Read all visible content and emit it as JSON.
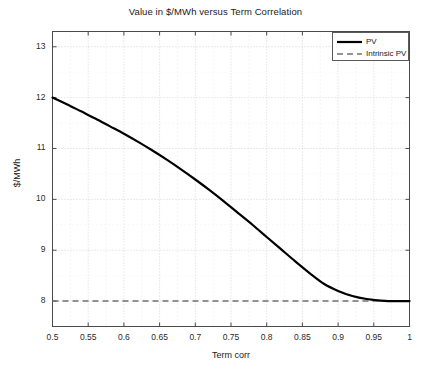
{
  "chart_data": {
    "type": "line",
    "title": "Value in $/MWh versus Term Correlation",
    "xlabel": "Term corr",
    "ylabel": "$/MWh",
    "xlim": [
      0.5,
      1.0
    ],
    "ylim": [
      7.5,
      13.3
    ],
    "grid": true,
    "grid_style": "dotted",
    "legend_position": "top-right",
    "xticks": [
      0.5,
      0.55,
      0.6,
      0.65,
      0.7,
      0.75,
      0.8,
      0.85,
      0.9,
      0.95,
      1
    ],
    "xtick_labels": [
      "0.5",
      "0.55",
      "0.6",
      "0.65",
      "0.7",
      "0.75",
      "0.8",
      "0.85",
      "0.9",
      "0.95",
      "1"
    ],
    "yticks": [
      8,
      9,
      10,
      11,
      12,
      13
    ],
    "ytick_labels": [
      "8",
      "9",
      "10",
      "11",
      "12",
      "13"
    ],
    "series": [
      {
        "name": "PV",
        "style": "solid",
        "color": "#000000",
        "width": 2.2,
        "x": [
          0.5,
          0.52,
          0.54,
          0.56,
          0.58,
          0.6,
          0.62,
          0.64,
          0.66,
          0.68,
          0.7,
          0.72,
          0.74,
          0.76,
          0.78,
          0.8,
          0.82,
          0.84,
          0.86,
          0.88,
          0.9,
          0.92,
          0.94,
          0.96,
          0.97,
          0.98,
          0.99,
          1.0
        ],
        "y": [
          12.0,
          11.87,
          11.73,
          11.59,
          11.44,
          11.29,
          11.13,
          10.96,
          10.78,
          10.59,
          10.39,
          10.18,
          9.96,
          9.73,
          9.5,
          9.26,
          9.02,
          8.78,
          8.55,
          8.34,
          8.2,
          8.1,
          8.04,
          8.01,
          8.0,
          8.0,
          8.0,
          8.0
        ]
      },
      {
        "name": "Intrinsic PV",
        "style": "dashed",
        "color": "#707070",
        "width": 1.6,
        "x": [
          0.5,
          1.0
        ],
        "y": [
          8.0,
          8.0
        ]
      }
    ]
  },
  "legend": {
    "entries": [
      {
        "label": "PV"
      },
      {
        "label": "Intrinsic PV"
      }
    ]
  }
}
